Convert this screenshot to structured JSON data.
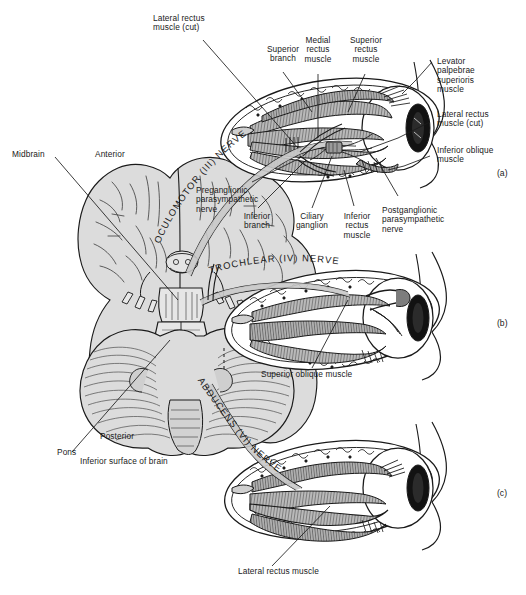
{
  "figure": {
    "title": "Inferior surface of brain",
    "caption_bottom": "Inferior surface of brain",
    "colors": {
      "ink": "#1a1a1a",
      "brain_fill": "#d9d9d9",
      "muscle_fill": "#8a8a8a",
      "nerve_fill": "#c8c8c8",
      "pupil": "#111111",
      "background": "#ffffff"
    }
  },
  "panels": [
    {
      "id": "a",
      "label": "(a)",
      "nerve": "OCULOMOTOR (III) NERVE"
    },
    {
      "id": "b",
      "label": "(b)",
      "nerve": "TROCHLEAR (IV) NERVE"
    },
    {
      "id": "c",
      "label": "(c)",
      "nerve": "ABDUCENS (VI) NERVE"
    }
  ],
  "nerve_labels": {
    "oculomotor": "OCULOMOTOR (III) NERVE",
    "trochlear": "TROCHLEAR (IV) NERVE",
    "abducens": "ABDUCENS (VI) NERVE"
  },
  "labels": {
    "lateral_rectus_cut_top": "Lateral rectus\nmuscle (cut)",
    "superior_branch": "Superior\nbranch",
    "medial_rectus": "Medial\nrectus\nmuscle",
    "superior_rectus": "Superior\nrectus\nmuscle",
    "levator_palpebrae": "Levator\npalpebrae\nsuperioris\nmuscle",
    "lateral_rectus_cut_right": "Lateral rectus\nmuscle (cut)",
    "inferior_oblique": "Inferior oblique\nmuscle",
    "midbrain": "Midbrain",
    "anterior": "Anterior",
    "preganglionic": "Preganglionic\nparasympathetic\nnerve",
    "inferior_branch": "Inferior\nbranch",
    "ciliary_ganglion": "Ciliary\nganglion",
    "inferior_rectus": "Inferior\nrectus\nmuscle",
    "postganglionic": "Postganglionic\nparasympathetic\nnerve",
    "superior_oblique": "Superior oblique muscle",
    "pons": "Pons",
    "posterior": "Posterior",
    "inferior_surface": "Inferior surface of brain",
    "lateral_rectus_bottom": "Lateral rectus muscle"
  }
}
